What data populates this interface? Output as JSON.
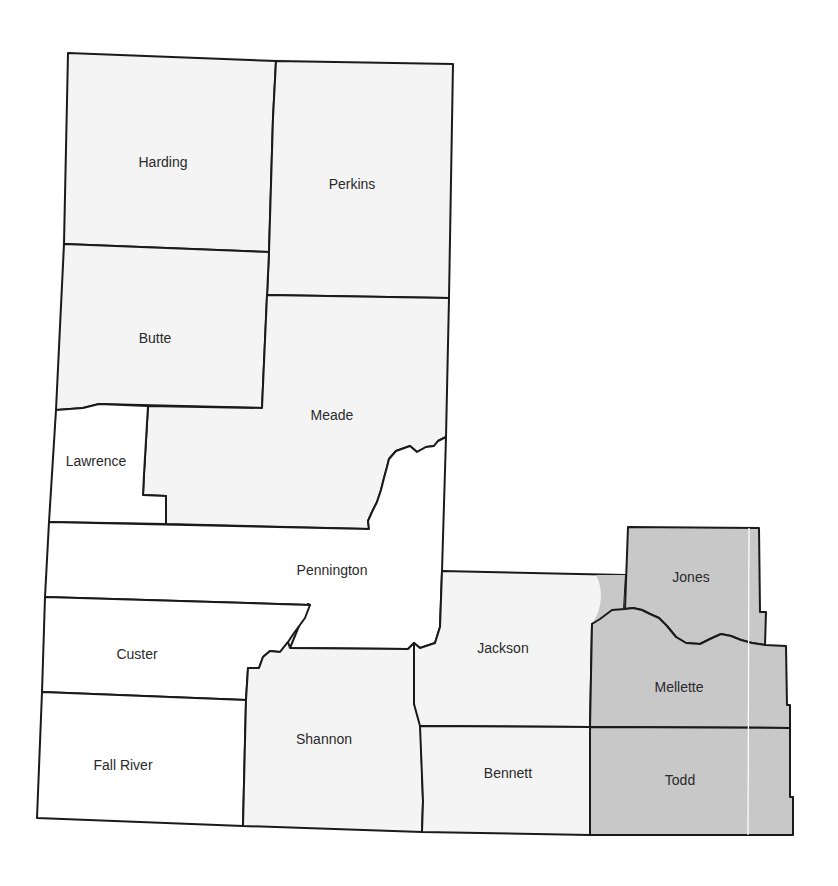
{
  "map": {
    "type": "county-map",
    "colors": {
      "unshaded": "#ffffff",
      "light": "#f4f4f4",
      "shaded": "#c8c8c8",
      "border": "#1a1a1a",
      "label": "#2a2a2a"
    },
    "counties": [
      {
        "name": "Harding",
        "shaded": false,
        "label_x": 163,
        "label_y": 163
      },
      {
        "name": "Perkins",
        "shaded": false,
        "label_x": 352,
        "label_y": 185
      },
      {
        "name": "Butte",
        "shaded": false,
        "label_x": 155,
        "label_y": 339
      },
      {
        "name": "Meade",
        "shaded": false,
        "label_x": 332,
        "label_y": 416
      },
      {
        "name": "Lawrence",
        "shaded": false,
        "label_x": 96,
        "label_y": 462
      },
      {
        "name": "Pennington",
        "shaded": false,
        "label_x": 332,
        "label_y": 571
      },
      {
        "name": "Custer",
        "shaded": false,
        "label_x": 137,
        "label_y": 655
      },
      {
        "name": "Fall River",
        "shaded": false,
        "label_x": 123,
        "label_y": 766
      },
      {
        "name": "Shannon",
        "shaded": false,
        "label_x": 324,
        "label_y": 740
      },
      {
        "name": "Jackson",
        "shaded": false,
        "label_x": 503,
        "label_y": 649
      },
      {
        "name": "Bennett",
        "shaded": false,
        "label_x": 508,
        "label_y": 774
      },
      {
        "name": "Jones",
        "shaded": true,
        "label_x": 691,
        "label_y": 578
      },
      {
        "name": "Mellette",
        "shaded": true,
        "label_x": 679,
        "label_y": 688
      },
      {
        "name": "Todd",
        "shaded": true,
        "label_x": 680,
        "label_y": 781
      }
    ]
  }
}
